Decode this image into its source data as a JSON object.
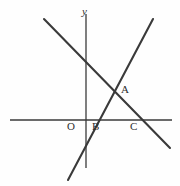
{
  "figure": {
    "background_color": "#fefefe",
    "stroke_color": "#3a3a3a",
    "text_color": "#2e2e2e"
  },
  "axes": {
    "y_axis_label": "y",
    "x_axis": {
      "x1": 10,
      "y1": 120,
      "x2": 172,
      "y2": 120
    },
    "y_axis": {
      "x1": 86,
      "y1": 14,
      "x2": 86,
      "y2": 168
    },
    "origin": {
      "x": 86,
      "y": 120
    }
  },
  "labels": {
    "origin": "O",
    "point_a": "A",
    "point_b": "B",
    "point_c": "C"
  },
  "chart_data": {
    "type": "line",
    "xlabel": "",
    "ylabel": "y",
    "grid": false,
    "legend": "none",
    "series": [
      {
        "name": "descending-line",
        "direction": "negative-slope",
        "points": [
          {
            "x": 44,
            "y": 19
          },
          {
            "x": 170,
            "y": 148
          }
        ],
        "x_intercept_label": "C",
        "x_intercept": {
          "x": 137,
          "y": 120
        }
      },
      {
        "name": "ascending-line",
        "direction": "positive-slope",
        "points": [
          {
            "x": 68,
            "y": 180
          },
          {
            "x": 153,
            "y": 19
          }
        ],
        "x_intercept_label": "B",
        "x_intercept": {
          "x": 91,
          "y": 120
        }
      }
    ],
    "annotations": [
      {
        "label": "A",
        "meaning": "intersection of the two lines",
        "x": 118,
        "y": 89
      },
      {
        "label": "B",
        "meaning": "x-intercept of ascending line",
        "x": 91,
        "y": 120
      },
      {
        "label": "C",
        "meaning": "x-intercept of descending line",
        "x": 137,
        "y": 120
      },
      {
        "label": "O",
        "meaning": "origin",
        "x": 86,
        "y": 120
      }
    ]
  }
}
